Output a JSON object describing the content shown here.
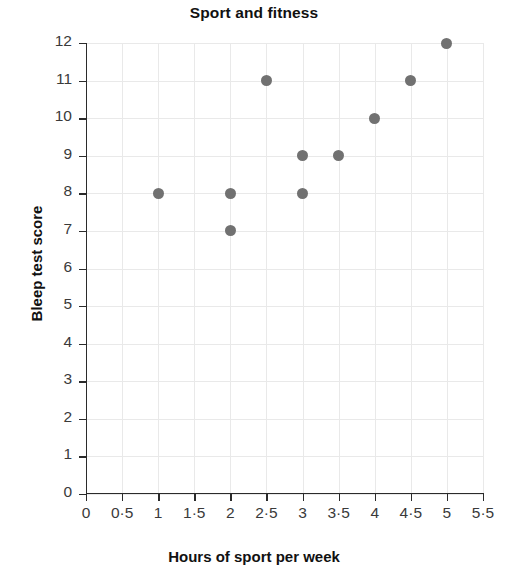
{
  "chart_data": {
    "type": "scatter",
    "title": "Sport and fitness",
    "xlabel": "Hours of sport per week",
    "ylabel": "Bleep test score",
    "xlim": [
      0,
      5.5
    ],
    "ylim": [
      0,
      12
    ],
    "grid": true,
    "legend": null,
    "marker_color": "#717171",
    "x_tick_labels": [
      "0",
      "0·5",
      "1",
      "1·5",
      "2",
      "2·5",
      "3",
      "3·5",
      "4",
      "4·5",
      "5",
      "5·5"
    ],
    "x_tick_values": [
      0,
      0.5,
      1,
      1.5,
      2,
      2.5,
      3,
      3.5,
      4,
      4.5,
      5,
      5.5
    ],
    "y_tick_labels": [
      "0",
      "1",
      "2",
      "3",
      "4",
      "5",
      "6",
      "7",
      "8",
      "9",
      "10",
      "11",
      "12"
    ],
    "y_tick_values": [
      0,
      1,
      2,
      3,
      4,
      5,
      6,
      7,
      8,
      9,
      10,
      11,
      12
    ],
    "points": [
      {
        "x": 1,
        "y": 8
      },
      {
        "x": 2,
        "y": 7
      },
      {
        "x": 2,
        "y": 8
      },
      {
        "x": 2.5,
        "y": 11
      },
      {
        "x": 3,
        "y": 8
      },
      {
        "x": 3,
        "y": 9
      },
      {
        "x": 3.5,
        "y": 9
      },
      {
        "x": 4,
        "y": 10
      },
      {
        "x": 4.5,
        "y": 11
      },
      {
        "x": 5,
        "y": 12
      }
    ]
  }
}
